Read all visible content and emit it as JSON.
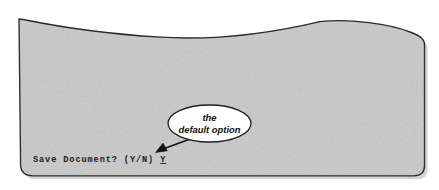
{
  "figure": {
    "name": "crt-screen-illustration",
    "background_color": "#ffffff",
    "screen": {
      "name": "crt-screen-surface",
      "fill_color": "#c9c9c9",
      "border_color": "#2b2b2b",
      "shadow_color": "#9a9a9a"
    },
    "prompt": {
      "full_text": "Save Document? (Y/N) Y",
      "message": "Save Document? (Y/N)",
      "default_answer": "Y",
      "text_color": "#1a1a1a"
    },
    "callout": {
      "name": "annotation-callout",
      "line1": "the",
      "line2": "default option",
      "fill_color": "#ffffff",
      "border_color": "#1f1f1f",
      "arrow_color": "#111111"
    }
  }
}
